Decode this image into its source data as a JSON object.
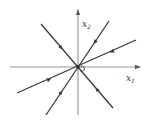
{
  "diagram": {
    "type": "phase-portrait",
    "axes": {
      "horizontal": {
        "label": "x",
        "subscript": "1"
      },
      "vertical": {
        "label": "x",
        "subscript": "2"
      }
    },
    "equilibrium": {
      "kind": "stable-node",
      "at": "origin"
    },
    "trajectories": [
      {
        "name": "line-a",
        "direction_slope_sign": "negative",
        "flow": "toward-origin"
      },
      {
        "name": "line-b",
        "direction_slope_sign": "positive-steep",
        "flow": "toward-origin"
      },
      {
        "name": "line-c",
        "direction_slope_sign": "positive-shallow",
        "flow": "toward-origin"
      }
    ],
    "colors": {
      "trajectory": "#3a3a3a",
      "axis": "#9a9a9a",
      "background": "#ffffff"
    }
  }
}
